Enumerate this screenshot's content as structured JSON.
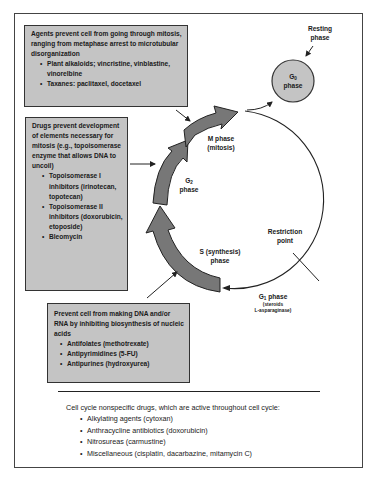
{
  "boxes": {
    "mitosis_agents": {
      "description": "Agents prevent cell from going through mitosis, ranging from metaphase arrest to microtubular disorganization",
      "items": [
        "Plant alkaloids; vincristine, vinblastine, vinorelbine",
        "Taxanes: paclitaxel, docetaxel"
      ]
    },
    "g2_agents": {
      "description": "Drugs prevent development of elements necessary for mitosis (e.g., topoisomerase enzyme that allows DNA to uncoil)",
      "items": [
        "Topoisomerase I inhibitors (irinotecan, topotecan)",
        "Topoisomerase II inhibitors (doxorubicin, etoposide)",
        "Bleomycin"
      ]
    },
    "s_phase_agents": {
      "description": "Prevent cell from making DNA and/or RNA by inhibiting biosynthesis of nucleic acids",
      "items": [
        "Antifolates (methotrexate)",
        "Antipyrimidines (5-FU)",
        "Antipurines (hydroxyurea)"
      ]
    }
  },
  "cycle": {
    "resting_label_1": "Resting",
    "resting_label_2": "phase",
    "g0": {
      "letter": "G",
      "sub": "0",
      "word": "phase"
    },
    "m_phase": {
      "line1": "M phase",
      "line2": "(mitosis)"
    },
    "g2_phase": {
      "letter": "G",
      "sub": "2",
      "word": "phase"
    },
    "s_phase": {
      "line1": "S (synthesis)",
      "line2": "phase"
    },
    "restriction": {
      "line1": "Restriction",
      "line2": "point"
    },
    "g1_phase": {
      "letter": "G",
      "sub": "1",
      "word": " phase",
      "note1": "(steroids",
      "note2": "L-asparaginase)"
    }
  },
  "nonspecific": {
    "heading": "Cell cycle nonspecific drugs, which are active throughout cell cycle:",
    "items": [
      "Alkylating agents (cytoxan)",
      "Anthracycline antibiotics (doxorubicin)",
      "Nitrosureas (carmustine)",
      "Miscellaneous (cisplatin, dacarbazine, mitamycin C)"
    ]
  },
  "colors": {
    "box_fill": "#c4c4c4",
    "arrow_fill": "#777777",
    "g0_fill": "#c4c4c4",
    "line": "#222222"
  }
}
